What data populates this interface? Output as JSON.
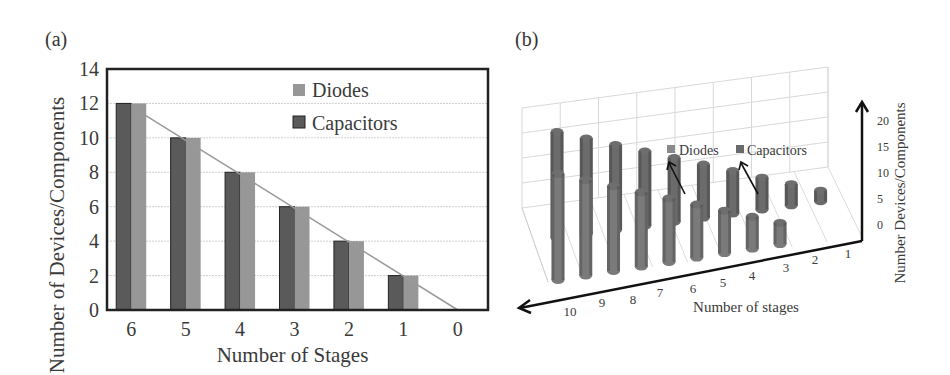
{
  "panels": {
    "a": {
      "label": "(a)"
    },
    "b": {
      "label": "(b)"
    }
  },
  "colors": {
    "capacitors": "#5a5a5a",
    "diodes": "#979797",
    "trend_line": "#9a9a9a",
    "grid": "#cfcfcf",
    "frame": "#222222"
  },
  "chart_data": [
    {
      "type": "bar",
      "panel": "(a)",
      "title": "",
      "xlabel": "Number of Stages",
      "ylabel": "Number of Devices/Components",
      "categories": [
        "6",
        "5",
        "4",
        "3",
        "2",
        "1",
        "0"
      ],
      "series": [
        {
          "name": "Capacitors",
          "values": [
            12,
            10,
            8,
            6,
            4,
            2,
            0
          ]
        },
        {
          "name": "Diodes",
          "values": [
            12,
            10,
            8,
            6,
            4,
            2,
            0
          ]
        }
      ],
      "trend_line": {
        "from": [
          6,
          12
        ],
        "to": [
          0,
          0
        ]
      },
      "yticks": [
        0,
        2,
        4,
        6,
        8,
        10,
        12,
        14
      ],
      "ylim": [
        0,
        14
      ],
      "grid": true,
      "legend": {
        "position": "upper-right",
        "entries": [
          "Diodes",
          "Capacitors"
        ]
      }
    },
    {
      "type": "bar3d",
      "panel": "(b)",
      "title": "",
      "xlabel": "Number of stages",
      "zlabel": "Number Devices/Components",
      "categories": [
        "10",
        "9",
        "8",
        "7",
        "6",
        "5",
        "4",
        "3",
        "2",
        "1"
      ],
      "series": [
        {
          "name": "Capacitors",
          "values": [
            20,
            18,
            16,
            14,
            12,
            10,
            8,
            6,
            4,
            2
          ]
        },
        {
          "name": "Diodes",
          "values": [
            20,
            18,
            16,
            14,
            12,
            10,
            8,
            6,
            4,
            null
          ]
        }
      ],
      "zticks": [
        0,
        5,
        10,
        15,
        20
      ],
      "zlim": [
        0,
        20
      ],
      "grid": true,
      "legend": {
        "position": "inside-top",
        "entries": [
          "Diodes",
          "Capacitors"
        ],
        "style": "callout-arrows"
      }
    }
  ]
}
